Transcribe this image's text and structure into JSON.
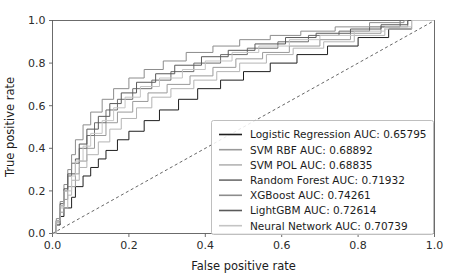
{
  "chart_data": {
    "type": "line",
    "title": "",
    "xlabel": "False positive rate",
    "ylabel": "True positive rate",
    "xlim": [
      0.0,
      1.0
    ],
    "ylim": [
      0.0,
      1.0
    ],
    "xticks": [
      "0.0",
      "0.2",
      "0.4",
      "0.6",
      "0.8",
      "1.0"
    ],
    "yticks": [
      "0.0",
      "0.2",
      "0.4",
      "0.6",
      "0.8",
      "1.0"
    ],
    "xtick_values": [
      0.0,
      0.2,
      0.4,
      0.6,
      0.8,
      1.0
    ],
    "ytick_values": [
      0.0,
      0.2,
      0.4,
      0.6,
      0.8,
      1.0
    ],
    "grid": false,
    "legend_position": "lower right",
    "reference_line": {
      "name": "chance-diagonal",
      "style": "dashed",
      "color": "#555555",
      "x": [
        0.0,
        1.0
      ],
      "y": [
        0.0,
        1.0
      ]
    },
    "series": [
      {
        "name": "Logistic Regression",
        "auc": "0.65795",
        "legend_label": "Logistic Regression AUC: 0.65795",
        "color": "#1f1f1f",
        "x": [
          0.0,
          0.01,
          0.01,
          0.02,
          0.02,
          0.03,
          0.03,
          0.05,
          0.05,
          0.06,
          0.06,
          0.08,
          0.08,
          0.1,
          0.1,
          0.12,
          0.12,
          0.14,
          0.14,
          0.17,
          0.17,
          0.2,
          0.2,
          0.24,
          0.24,
          0.28,
          0.28,
          0.33,
          0.33,
          0.38,
          0.38,
          0.44,
          0.44,
          0.5,
          0.5,
          0.57,
          0.57,
          0.64,
          0.64,
          0.72,
          0.72,
          0.8,
          0.8,
          0.88,
          0.88,
          0.94,
          0.94,
          1.0
        ],
        "y": [
          0.0,
          0.0,
          0.04,
          0.04,
          0.08,
          0.08,
          0.12,
          0.12,
          0.17,
          0.17,
          0.22,
          0.22,
          0.27,
          0.27,
          0.31,
          0.31,
          0.35,
          0.35,
          0.39,
          0.39,
          0.44,
          0.44,
          0.48,
          0.48,
          0.53,
          0.53,
          0.58,
          0.58,
          0.63,
          0.63,
          0.68,
          0.68,
          0.72,
          0.72,
          0.76,
          0.76,
          0.8,
          0.8,
          0.84,
          0.84,
          0.88,
          0.88,
          0.92,
          0.92,
          0.96,
          0.96,
          1.0,
          1.0
        ]
      },
      {
        "name": "SVM RBF",
        "auc": "0.68892",
        "legend_label": "SVM RBF AUC: 0.68892",
        "color": "#9a9a9a",
        "x": [
          0.0,
          0.01,
          0.01,
          0.02,
          0.02,
          0.03,
          0.03,
          0.04,
          0.04,
          0.06,
          0.06,
          0.07,
          0.07,
          0.09,
          0.09,
          0.11,
          0.11,
          0.14,
          0.14,
          0.17,
          0.17,
          0.21,
          0.21,
          0.25,
          0.25,
          0.3,
          0.3,
          0.36,
          0.36,
          0.42,
          0.42,
          0.48,
          0.48,
          0.55,
          0.55,
          0.62,
          0.62,
          0.7,
          0.7,
          0.78,
          0.78,
          0.86,
          0.86,
          0.93,
          0.93,
          1.0
        ],
        "y": [
          0.0,
          0.0,
          0.05,
          0.05,
          0.1,
          0.1,
          0.16,
          0.16,
          0.22,
          0.22,
          0.28,
          0.28,
          0.34,
          0.34,
          0.4,
          0.4,
          0.46,
          0.46,
          0.52,
          0.52,
          0.57,
          0.57,
          0.62,
          0.62,
          0.66,
          0.66,
          0.7,
          0.7,
          0.74,
          0.74,
          0.78,
          0.78,
          0.82,
          0.82,
          0.85,
          0.85,
          0.88,
          0.88,
          0.91,
          0.91,
          0.94,
          0.94,
          0.97,
          0.97,
          1.0,
          1.0
        ]
      },
      {
        "name": "SVM POL",
        "auc": "0.68835",
        "legend_label": "SVM POL AUC: 0.68835",
        "color": "#b4b4b4",
        "x": [
          0.0,
          0.01,
          0.01,
          0.02,
          0.02,
          0.04,
          0.04,
          0.05,
          0.05,
          0.07,
          0.07,
          0.09,
          0.09,
          0.12,
          0.12,
          0.15,
          0.15,
          0.18,
          0.18,
          0.22,
          0.22,
          0.26,
          0.26,
          0.31,
          0.31,
          0.37,
          0.37,
          0.43,
          0.43,
          0.49,
          0.49,
          0.56,
          0.56,
          0.63,
          0.63,
          0.71,
          0.71,
          0.79,
          0.79,
          0.87,
          0.87,
          0.94,
          0.94,
          1.0
        ],
        "y": [
          0.0,
          0.0,
          0.06,
          0.06,
          0.12,
          0.12,
          0.18,
          0.18,
          0.25,
          0.25,
          0.31,
          0.31,
          0.37,
          0.37,
          0.43,
          0.43,
          0.49,
          0.49,
          0.54,
          0.54,
          0.59,
          0.59,
          0.64,
          0.64,
          0.68,
          0.68,
          0.72,
          0.72,
          0.76,
          0.76,
          0.8,
          0.8,
          0.84,
          0.84,
          0.87,
          0.87,
          0.9,
          0.9,
          0.93,
          0.93,
          0.96,
          0.96,
          1.0,
          1.0
        ]
      },
      {
        "name": "Random Forest",
        "auc": "0.71932",
        "legend_label": "Random Forest AUC: 0.71932",
        "color": "#6e6e6e",
        "x": [
          0.0,
          0.01,
          0.01,
          0.02,
          0.02,
          0.03,
          0.03,
          0.04,
          0.04,
          0.05,
          0.05,
          0.07,
          0.07,
          0.09,
          0.09,
          0.11,
          0.11,
          0.14,
          0.14,
          0.17,
          0.17,
          0.21,
          0.21,
          0.26,
          0.26,
          0.31,
          0.31,
          0.37,
          0.37,
          0.44,
          0.44,
          0.51,
          0.51,
          0.59,
          0.59,
          0.67,
          0.67,
          0.75,
          0.75,
          0.83,
          0.83,
          0.91,
          0.91,
          1.0
        ],
        "y": [
          0.0,
          0.0,
          0.06,
          0.06,
          0.13,
          0.13,
          0.2,
          0.2,
          0.27,
          0.27,
          0.33,
          0.33,
          0.4,
          0.4,
          0.46,
          0.46,
          0.52,
          0.52,
          0.58,
          0.58,
          0.63,
          0.63,
          0.68,
          0.68,
          0.72,
          0.72,
          0.76,
          0.76,
          0.8,
          0.8,
          0.84,
          0.84,
          0.87,
          0.87,
          0.9,
          0.9,
          0.93,
          0.93,
          0.95,
          0.95,
          0.97,
          0.97,
          1.0,
          1.0
        ]
      },
      {
        "name": "XGBoost",
        "auc": "0.74261",
        "legend_label": "XGBoost AUC: 0.74261",
        "color": "#8c8c8c",
        "x": [
          0.0,
          0.01,
          0.01,
          0.02,
          0.02,
          0.03,
          0.03,
          0.04,
          0.04,
          0.05,
          0.05,
          0.06,
          0.06,
          0.08,
          0.08,
          0.1,
          0.1,
          0.13,
          0.13,
          0.16,
          0.16,
          0.2,
          0.2,
          0.24,
          0.24,
          0.29,
          0.29,
          0.35,
          0.35,
          0.42,
          0.42,
          0.49,
          0.49,
          0.57,
          0.57,
          0.65,
          0.65,
          0.74,
          0.74,
          0.83,
          0.83,
          0.92,
          0.92,
          1.0
        ],
        "y": [
          0.0,
          0.0,
          0.07,
          0.07,
          0.15,
          0.15,
          0.23,
          0.23,
          0.3,
          0.3,
          0.37,
          0.37,
          0.44,
          0.44,
          0.51,
          0.51,
          0.57,
          0.57,
          0.63,
          0.63,
          0.68,
          0.68,
          0.73,
          0.73,
          0.77,
          0.77,
          0.81,
          0.81,
          0.85,
          0.85,
          0.88,
          0.88,
          0.91,
          0.91,
          0.93,
          0.93,
          0.95,
          0.95,
          0.97,
          0.97,
          0.99,
          0.99,
          1.0,
          1.0
        ]
      },
      {
        "name": "LightGBM",
        "auc": "0.72614",
        "legend_label": "LightGBM AUC: 0.72614",
        "color": "#5a5a5a",
        "x": [
          0.0,
          0.01,
          0.01,
          0.02,
          0.02,
          0.03,
          0.03,
          0.04,
          0.04,
          0.06,
          0.06,
          0.07,
          0.07,
          0.09,
          0.09,
          0.12,
          0.12,
          0.15,
          0.15,
          0.18,
          0.18,
          0.22,
          0.22,
          0.27,
          0.27,
          0.32,
          0.32,
          0.39,
          0.39,
          0.46,
          0.46,
          0.53,
          0.53,
          0.61,
          0.61,
          0.69,
          0.69,
          0.78,
          0.78,
          0.86,
          0.86,
          0.93,
          0.93,
          1.0
        ],
        "y": [
          0.0,
          0.0,
          0.06,
          0.06,
          0.14,
          0.14,
          0.21,
          0.21,
          0.28,
          0.28,
          0.35,
          0.35,
          0.42,
          0.42,
          0.49,
          0.49,
          0.55,
          0.55,
          0.61,
          0.61,
          0.66,
          0.66,
          0.71,
          0.71,
          0.75,
          0.75,
          0.79,
          0.79,
          0.83,
          0.83,
          0.86,
          0.86,
          0.89,
          0.89,
          0.92,
          0.92,
          0.94,
          0.94,
          0.96,
          0.96,
          0.98,
          0.98,
          1.0,
          1.0
        ]
      },
      {
        "name": "Neural Network",
        "auc": "0.70739",
        "legend_label": "Neural Network AUC: 0.70739",
        "color": "#c4c4c4",
        "x": [
          0.0,
          0.01,
          0.01,
          0.02,
          0.02,
          0.03,
          0.03,
          0.05,
          0.05,
          0.06,
          0.06,
          0.08,
          0.08,
          0.1,
          0.1,
          0.13,
          0.13,
          0.16,
          0.16,
          0.19,
          0.19,
          0.23,
          0.23,
          0.28,
          0.28,
          0.34,
          0.34,
          0.4,
          0.4,
          0.47,
          0.47,
          0.54,
          0.54,
          0.62,
          0.62,
          0.7,
          0.7,
          0.79,
          0.79,
          0.87,
          0.87,
          0.94,
          0.94,
          1.0
        ],
        "y": [
          0.0,
          0.0,
          0.06,
          0.06,
          0.13,
          0.13,
          0.2,
          0.2,
          0.27,
          0.27,
          0.34,
          0.34,
          0.41,
          0.41,
          0.47,
          0.47,
          0.53,
          0.53,
          0.59,
          0.59,
          0.64,
          0.64,
          0.69,
          0.69,
          0.73,
          0.73,
          0.77,
          0.77,
          0.81,
          0.81,
          0.85,
          0.85,
          0.88,
          0.88,
          0.91,
          0.91,
          0.93,
          0.93,
          0.95,
          0.95,
          0.97,
          0.97,
          1.0,
          1.0
        ]
      }
    ]
  }
}
